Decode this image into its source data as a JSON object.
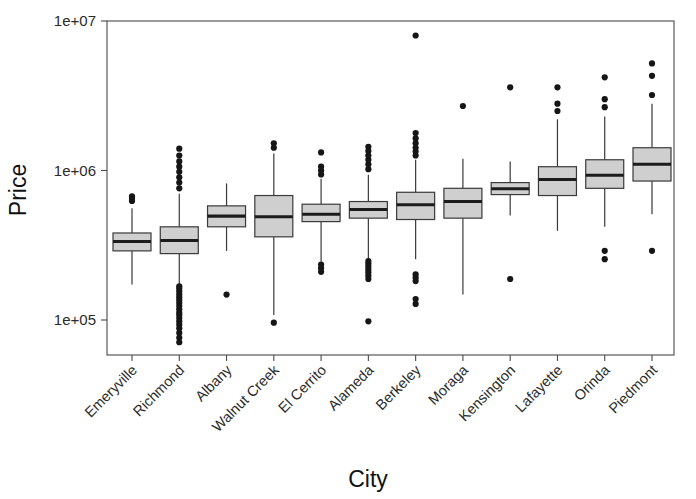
{
  "chart_data": {
    "type": "boxplot",
    "title": "",
    "xlabel": "City",
    "ylabel": "Price",
    "yscale": "log",
    "ylim": [
      70000,
      10000000
    ],
    "ytick_labels": [
      "1e+07",
      "1e+06",
      "1e+05"
    ],
    "ytick_values": [
      10000000,
      1000000,
      100000
    ],
    "grid": false,
    "legend": null,
    "categories": [
      "Emeryville",
      "Richmond",
      "Albany",
      "Walnut Creek",
      "El Cerrito",
      "Alameda",
      "Berkeley",
      "Moraga",
      "Kensington",
      "Lafayette",
      "Orinda",
      "Piedmont"
    ],
    "boxes": [
      {
        "category": "Emeryville",
        "whisker_low": 173000,
        "q1": 290000,
        "median": 335000,
        "q3": 382000,
        "whisker_high": 560000,
        "outliers": [
          625000,
          648000,
          672000
        ]
      },
      {
        "category": "Richmond",
        "whisker_low": 172000,
        "q1": 278000,
        "median": 340000,
        "q3": 420000,
        "whisker_high": 700000,
        "outliers": [
          71000,
          76000,
          82000,
          88000,
          93000,
          98000,
          103000,
          108000,
          112000,
          118000,
          124000,
          130000,
          136000,
          142000,
          148000,
          155000,
          162000,
          168000,
          760000,
          830000,
          900000,
          980000,
          1060000,
          1150000,
          1260000,
          1400000
        ]
      },
      {
        "category": "Albany",
        "whisker_low": 290000,
        "q1": 420000,
        "median": 495000,
        "q3": 580000,
        "whisker_high": 820000,
        "outliers": [
          148000
        ]
      },
      {
        "category": "Walnut Creek",
        "whisker_low": 108000,
        "q1": 360000,
        "median": 490000,
        "q3": 680000,
        "whisker_high": 1300000,
        "outliers": [
          96000,
          1420000,
          1520000
        ]
      },
      {
        "category": "El Cerrito",
        "whisker_low": 245000,
        "q1": 455000,
        "median": 510000,
        "q3": 595000,
        "whisker_high": 880000,
        "outliers": [
          210000,
          222000,
          235000,
          940000,
          1000000,
          1060000,
          1320000
        ]
      },
      {
        "category": "Alameda",
        "whisker_low": 255000,
        "q1": 480000,
        "median": 548000,
        "q3": 620000,
        "whisker_high": 935000,
        "outliers": [
          98000,
          188000,
          198000,
          208000,
          218000,
          228000,
          238000,
          248000,
          1020000,
          1100000,
          1180000,
          1260000,
          1350000,
          1440000
        ]
      },
      {
        "category": "Berkeley",
        "whisker_low": 255000,
        "q1": 470000,
        "median": 590000,
        "q3": 715000,
        "whisker_high": 1180000,
        "outliers": [
          128000,
          138000,
          182000,
          192000,
          202000,
          1260000,
          1340000,
          1420000,
          1520000,
          1640000,
          1780000,
          8000000
        ]
      },
      {
        "category": "Moraga",
        "whisker_low": 148000,
        "q1": 480000,
        "median": 620000,
        "q3": 760000,
        "whisker_high": 1200000,
        "outliers": [
          2700000
        ]
      },
      {
        "category": "Kensington",
        "whisker_low": 500000,
        "q1": 690000,
        "median": 755000,
        "q3": 830000,
        "whisker_high": 1150000,
        "outliers": [
          188000,
          3600000
        ]
      },
      {
        "category": "Lafayette",
        "whisker_low": 395000,
        "q1": 680000,
        "median": 870000,
        "q3": 1060000,
        "whisker_high": 2200000,
        "outliers": [
          2500000,
          2800000,
          3600000
        ]
      },
      {
        "category": "Orinda",
        "whisker_low": 420000,
        "q1": 760000,
        "median": 930000,
        "q3": 1180000,
        "whisker_high": 2300000,
        "outliers": [
          255000,
          290000,
          2650000,
          3000000,
          4200000
        ]
      },
      {
        "category": "Piedmont",
        "whisker_low": 510000,
        "q1": 850000,
        "median": 1100000,
        "q3": 1420000,
        "whisker_high": 2800000,
        "outliers": [
          290000,
          3200000,
          4300000,
          5200000
        ]
      }
    ]
  },
  "axes": {
    "colors": {
      "box_fill": "#cfcfcf",
      "box_stroke": "#3a3a3a",
      "median": "#1c1c1c",
      "outlier": "#161616",
      "frame": "#4a4a4a",
      "text": "#1a1a1a",
      "background": "#ffffff"
    }
  }
}
